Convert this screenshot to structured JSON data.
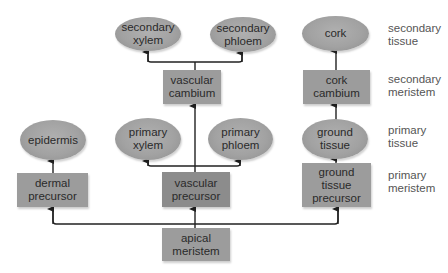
{
  "diagram": {
    "nodes": {
      "secondary_xylem": "secondary xylem",
      "secondary_phloem": "secondary phloem",
      "cork": "cork",
      "vascular_cambium": "vascular cambium",
      "cork_cambium": "cork cambium",
      "epidermis": "epidermis",
      "primary_xylem": "primary xylem",
      "primary_phloem": "primary phloem",
      "ground_tissue": "ground tissue",
      "dermal_precursor": "dermal precursor",
      "vascular_precursor": "vascular precursor",
      "ground_tissue_precursor": "ground tissue precursor",
      "apical_meristem": "apical meristem"
    },
    "row_labels": {
      "secondary_tissue": "secondary tissue",
      "secondary_meristem": "secondary meristem",
      "primary_tissue": "primary tissue",
      "primary_meristem": "primary meristem"
    },
    "colors": {
      "ellipse_fill": "#a2a2a2",
      "box_fill": "#9c9c9c",
      "box_dark_fill": "#8c8c8c",
      "arrow": "#222222",
      "label_text": "#555555"
    }
  }
}
